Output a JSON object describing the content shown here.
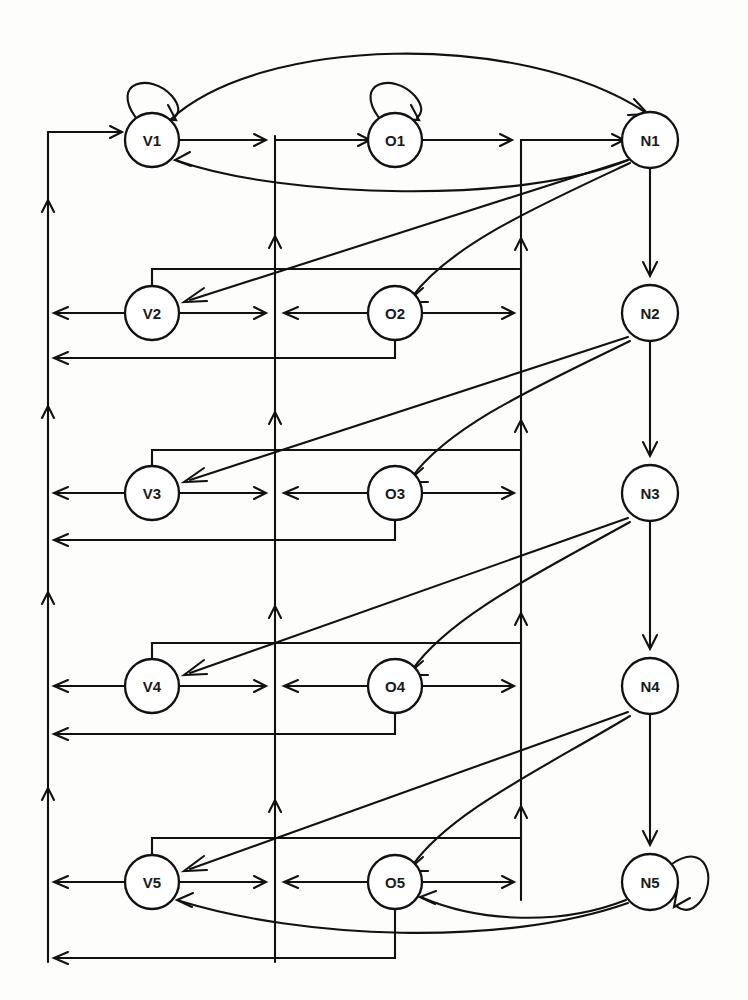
{
  "diagram": {
    "type": "state-transition-graph",
    "title": "",
    "background_color": "#fdfdfc",
    "stroke_color": "#111111",
    "node_fill": "#ffffff",
    "columns": [
      {
        "id": "V",
        "x": 152,
        "label_prefix": "V"
      },
      {
        "id": "O",
        "x": 395,
        "label_prefix": "O"
      },
      {
        "id": "N",
        "x": 650,
        "label_prefix": "N"
      }
    ],
    "rows_y": [
      140,
      313,
      493,
      686,
      882
    ],
    "node_radius": 27,
    "nodes": [
      {
        "id": "V1",
        "label": "V1",
        "col": 0,
        "row": 0,
        "self_loop": true
      },
      {
        "id": "O1",
        "label": "O1",
        "col": 1,
        "row": 0,
        "self_loop": true
      },
      {
        "id": "N1",
        "label": "N1",
        "col": 2,
        "row": 0,
        "self_loop": false
      },
      {
        "id": "V2",
        "label": "V2",
        "col": 0,
        "row": 1,
        "self_loop": false
      },
      {
        "id": "O2",
        "label": "O2",
        "col": 1,
        "row": 1,
        "self_loop": false
      },
      {
        "id": "N2",
        "label": "N2",
        "col": 2,
        "row": 1,
        "self_loop": false
      },
      {
        "id": "V3",
        "label": "V3",
        "col": 0,
        "row": 2,
        "self_loop": false
      },
      {
        "id": "O3",
        "label": "O3",
        "col": 1,
        "row": 2,
        "self_loop": false
      },
      {
        "id": "N3",
        "label": "N3",
        "col": 2,
        "row": 2,
        "self_loop": false
      },
      {
        "id": "V4",
        "label": "V4",
        "col": 0,
        "row": 3,
        "self_loop": false
      },
      {
        "id": "O4",
        "label": "O4",
        "col": 1,
        "row": 3,
        "self_loop": false
      },
      {
        "id": "N4",
        "label": "N4",
        "col": 2,
        "row": 3,
        "self_loop": false
      },
      {
        "id": "V5",
        "label": "V5",
        "col": 0,
        "row": 4,
        "self_loop": false
      },
      {
        "id": "O5",
        "label": "O5",
        "col": 1,
        "row": 4,
        "self_loop": false
      },
      {
        "id": "N5",
        "label": "N5",
        "col": 2,
        "row": 4,
        "self_loop": true
      }
    ],
    "buses": [
      {
        "id": "left-bus",
        "x": 48,
        "y1": 130,
        "y2": 960,
        "direction": "up"
      },
      {
        "id": "middle-bus",
        "x": 275,
        "y1": 136,
        "y2": 960,
        "direction": "up"
      },
      {
        "id": "right-bus",
        "x": 521,
        "y1": 140,
        "y2": 900,
        "direction": "up"
      }
    ],
    "edges": [
      {
        "from": "V1",
        "to": "O1",
        "kind": "horizontal"
      },
      {
        "from": "O1",
        "to": "N1",
        "kind": "horizontal"
      },
      {
        "from": "V1",
        "to": "N1",
        "kind": "top-arc"
      },
      {
        "from": "N1",
        "to": "V1",
        "kind": "return-arc"
      },
      {
        "from": "N1",
        "to": "N2",
        "kind": "chain"
      },
      {
        "from": "N2",
        "to": "N3",
        "kind": "chain"
      },
      {
        "from": "N3",
        "to": "N4",
        "kind": "chain"
      },
      {
        "from": "N4",
        "to": "N5",
        "kind": "chain"
      },
      {
        "from": "N1",
        "to": "V2",
        "kind": "feedback-diagonal"
      },
      {
        "from": "N1",
        "to": "O2",
        "kind": "feedback-curve"
      },
      {
        "from": "N2",
        "to": "V3",
        "kind": "feedback-diagonal"
      },
      {
        "from": "N2",
        "to": "O3",
        "kind": "feedback-curve"
      },
      {
        "from": "N3",
        "to": "V4",
        "kind": "feedback-diagonal"
      },
      {
        "from": "N3",
        "to": "O4",
        "kind": "feedback-curve"
      },
      {
        "from": "N4",
        "to": "V5",
        "kind": "feedback-diagonal"
      },
      {
        "from": "N4",
        "to": "O5",
        "kind": "feedback-curve"
      },
      {
        "from": "N5",
        "to": "O5",
        "kind": "bottom-arc"
      },
      {
        "from": "N5",
        "to": "V5",
        "kind": "bottom-arc"
      },
      {
        "from": "V1",
        "self": true,
        "kind": "self-loop"
      },
      {
        "from": "O1",
        "self": true,
        "kind": "self-loop"
      },
      {
        "from": "N5",
        "self": true,
        "kind": "self-loop"
      }
    ]
  }
}
